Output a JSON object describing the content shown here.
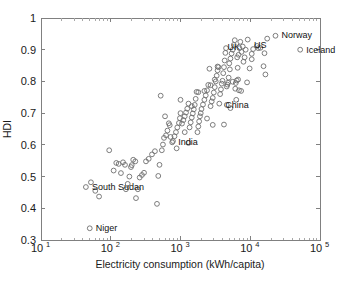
{
  "chart_data": {
    "type": "scatter",
    "title": "",
    "xlabel": "Electricity consumption (kWh/capita)",
    "ylabel": "HDI",
    "xscale": "log",
    "yscale": "linear",
    "xlim": [
      10,
      100000
    ],
    "ylim": [
      0.3,
      1.0
    ],
    "grid": false,
    "legend": "none",
    "marker": "open-circle",
    "marker_color": "#6e6e6e",
    "xticks": [
      {
        "value": 10,
        "label": "10",
        "exponent": "1"
      },
      {
        "value": 100,
        "label": "10",
        "exponent": "2"
      },
      {
        "value": 1000,
        "label": "10",
        "exponent": "3"
      },
      {
        "value": 10000,
        "label": "10",
        "exponent": "4"
      },
      {
        "value": 100000,
        "label": "10",
        "exponent": "5"
      }
    ],
    "yticks": [
      {
        "value": 0.3,
        "label": "0.3"
      },
      {
        "value": 0.4,
        "label": "0.4"
      },
      {
        "value": 0.5,
        "label": "0.5"
      },
      {
        "value": 0.6,
        "label": "0.6"
      },
      {
        "value": 0.7,
        "label": "0.7"
      },
      {
        "value": 0.8,
        "label": "0.8"
      },
      {
        "value": 0.9,
        "label": "0.9"
      },
      {
        "value": 1.0,
        "label": "1"
      }
    ],
    "annotations": [
      {
        "text": "Norway",
        "x": 23000,
        "y": 0.945,
        "dx": 6,
        "dy": 3
      },
      {
        "text": "Iceland",
        "x": 52000,
        "y": 0.9,
        "dx": 6,
        "dy": 3
      },
      {
        "text": "US",
        "x": 12500,
        "y": 0.915,
        "dx": -3,
        "dy": 3
      },
      {
        "text": "UK",
        "x": 5200,
        "y": 0.91,
        "dx": -3,
        "dy": 3
      },
      {
        "text": "China",
        "x": 3600,
        "y": 0.727,
        "dx": 6,
        "dy": 3
      },
      {
        "text": "India",
        "x": 760,
        "y": 0.609,
        "dx": 6,
        "dy": 3
      },
      {
        "text": "South Sudan",
        "x": 44,
        "y": 0.467,
        "dx": 6,
        "dy": 3
      },
      {
        "text": "Niger",
        "x": 50,
        "y": 0.337,
        "dx": 6,
        "dy": 3
      }
    ],
    "points": [
      {
        "x": 52000,
        "y": 0.9
      },
      {
        "x": 23000,
        "y": 0.944
      },
      {
        "x": 17500,
        "y": 0.935
      },
      {
        "x": 16000,
        "y": 0.889
      },
      {
        "x": 15500,
        "y": 0.848
      },
      {
        "x": 16500,
        "y": 0.822
      },
      {
        "x": 14000,
        "y": 0.906
      },
      {
        "x": 13000,
        "y": 0.905
      },
      {
        "x": 12500,
        "y": 0.912
      },
      {
        "x": 11000,
        "y": 0.902
      },
      {
        "x": 10500,
        "y": 0.87
      },
      {
        "x": 9800,
        "y": 0.841
      },
      {
        "x": 9200,
        "y": 0.932
      },
      {
        "x": 8600,
        "y": 0.9
      },
      {
        "x": 8300,
        "y": 0.876
      },
      {
        "x": 8000,
        "y": 0.862
      },
      {
        "x": 7800,
        "y": 0.91
      },
      {
        "x": 7500,
        "y": 0.893
      },
      {
        "x": 7200,
        "y": 0.925
      },
      {
        "x": 7000,
        "y": 0.905
      },
      {
        "x": 6800,
        "y": 0.884
      },
      {
        "x": 6500,
        "y": 0.876
      },
      {
        "x": 6600,
        "y": 0.843
      },
      {
        "x": 6400,
        "y": 0.803
      },
      {
        "x": 6200,
        "y": 0.795
      },
      {
        "x": 6100,
        "y": 0.777
      },
      {
        "x": 6900,
        "y": 0.772
      },
      {
        "x": 6000,
        "y": 0.93
      },
      {
        "x": 5800,
        "y": 0.915
      },
      {
        "x": 5600,
        "y": 0.9
      },
      {
        "x": 5400,
        "y": 0.888
      },
      {
        "x": 5200,
        "y": 0.872
      },
      {
        "x": 5000,
        "y": 0.857
      },
      {
        "x": 5100,
        "y": 0.838
      },
      {
        "x": 4900,
        "y": 0.812
      },
      {
        "x": 4800,
        "y": 0.796
      },
      {
        "x": 4700,
        "y": 0.79
      },
      {
        "x": 4600,
        "y": 0.784
      },
      {
        "x": 4500,
        "y": 0.905
      },
      {
        "x": 4400,
        "y": 0.89
      },
      {
        "x": 4300,
        "y": 0.866
      },
      {
        "x": 4200,
        "y": 0.845
      },
      {
        "x": 4100,
        "y": 0.826
      },
      {
        "x": 4000,
        "y": 0.802
      },
      {
        "x": 3900,
        "y": 0.793
      },
      {
        "x": 3800,
        "y": 0.775
      },
      {
        "x": 3700,
        "y": 0.76
      },
      {
        "x": 3600,
        "y": 0.73
      },
      {
        "x": 3500,
        "y": 0.845
      },
      {
        "x": 3400,
        "y": 0.835
      },
      {
        "x": 3300,
        "y": 0.818
      },
      {
        "x": 3200,
        "y": 0.8
      },
      {
        "x": 3100,
        "y": 0.782
      },
      {
        "x": 3000,
        "y": 0.765
      },
      {
        "x": 2900,
        "y": 0.748
      },
      {
        "x": 2800,
        "y": 0.737
      },
      {
        "x": 2700,
        "y": 0.722
      },
      {
        "x": 2600,
        "y": 0.84
      },
      {
        "x": 2500,
        "y": 0.789
      },
      {
        "x": 2400,
        "y": 0.772
      },
      {
        "x": 2300,
        "y": 0.756
      },
      {
        "x": 2200,
        "y": 0.742
      },
      {
        "x": 2100,
        "y": 0.727
      },
      {
        "x": 2000,
        "y": 0.713
      },
      {
        "x": 1950,
        "y": 0.7
      },
      {
        "x": 1900,
        "y": 0.69
      },
      {
        "x": 1850,
        "y": 0.674
      },
      {
        "x": 1800,
        "y": 0.658
      },
      {
        "x": 1750,
        "y": 0.64
      },
      {
        "x": 1700,
        "y": 0.767
      },
      {
        "x": 1650,
        "y": 0.745
      },
      {
        "x": 1600,
        "y": 0.726
      },
      {
        "x": 1550,
        "y": 0.712
      },
      {
        "x": 1500,
        "y": 0.699
      },
      {
        "x": 1450,
        "y": 0.686
      },
      {
        "x": 1400,
        "y": 0.671
      },
      {
        "x": 1350,
        "y": 0.655
      },
      {
        "x": 1300,
        "y": 0.73
      },
      {
        "x": 1250,
        "y": 0.714
      },
      {
        "x": 1200,
        "y": 0.702
      },
      {
        "x": 1150,
        "y": 0.69
      },
      {
        "x": 1100,
        "y": 0.678
      },
      {
        "x": 1050,
        "y": 0.667
      },
      {
        "x": 1000,
        "y": 0.7
      },
      {
        "x": 980,
        "y": 0.684
      },
      {
        "x": 950,
        "y": 0.669
      },
      {
        "x": 900,
        "y": 0.655
      },
      {
        "x": 860,
        "y": 0.64
      },
      {
        "x": 820,
        "y": 0.627
      },
      {
        "x": 780,
        "y": 0.612
      },
      {
        "x": 760,
        "y": 0.608
      },
      {
        "x": 720,
        "y": 0.625
      },
      {
        "x": 700,
        "y": 0.662
      },
      {
        "x": 680,
        "y": 0.668
      },
      {
        "x": 650,
        "y": 0.645
      },
      {
        "x": 620,
        "y": 0.63
      },
      {
        "x": 600,
        "y": 0.69
      },
      {
        "x": 580,
        "y": 0.622
      },
      {
        "x": 560,
        "y": 0.601
      },
      {
        "x": 540,
        "y": 0.583
      },
      {
        "x": 520,
        "y": 0.755
      },
      {
        "x": 500,
        "y": 0.537
      },
      {
        "x": 480,
        "y": 0.502
      },
      {
        "x": 460,
        "y": 0.414
      },
      {
        "x": 2400,
        "y": 0.683
      },
      {
        "x": 2900,
        "y": 0.663
      },
      {
        "x": 4200,
        "y": 0.664
      },
      {
        "x": 5200,
        "y": 0.716
      },
      {
        "x": 6300,
        "y": 0.742
      },
      {
        "x": 7400,
        "y": 0.77
      },
      {
        "x": 1150,
        "y": 0.64
      },
      {
        "x": 1300,
        "y": 0.606
      },
      {
        "x": 880,
        "y": 0.589
      },
      {
        "x": 430,
        "y": 0.58
      },
      {
        "x": 390,
        "y": 0.57
      },
      {
        "x": 350,
        "y": 0.556
      },
      {
        "x": 320,
        "y": 0.548
      },
      {
        "x": 300,
        "y": 0.512
      },
      {
        "x": 280,
        "y": 0.505
      },
      {
        "x": 260,
        "y": 0.497
      },
      {
        "x": 245,
        "y": 0.46
      },
      {
        "x": 230,
        "y": 0.432
      },
      {
        "x": 225,
        "y": 0.548
      },
      {
        "x": 210,
        "y": 0.553
      },
      {
        "x": 200,
        "y": 0.536
      },
      {
        "x": 195,
        "y": 0.53
      },
      {
        "x": 185,
        "y": 0.5
      },
      {
        "x": 175,
        "y": 0.477
      },
      {
        "x": 165,
        "y": 0.46
      },
      {
        "x": 160,
        "y": 0.537
      },
      {
        "x": 150,
        "y": 0.545
      },
      {
        "x": 140,
        "y": 0.511
      },
      {
        "x": 130,
        "y": 0.54
      },
      {
        "x": 120,
        "y": 0.543
      },
      {
        "x": 110,
        "y": 0.519
      },
      {
        "x": 95,
        "y": 0.583
      },
      {
        "x": 68,
        "y": 0.437
      },
      {
        "x": 60,
        "y": 0.455
      },
      {
        "x": 52,
        "y": 0.482
      },
      {
        "x": 50,
        "y": 0.337
      },
      {
        "x": 44,
        "y": 0.467
      },
      {
        "x": 1000,
        "y": 0.742
      },
      {
        "x": 1450,
        "y": 0.722
      },
      {
        "x": 1800,
        "y": 0.766
      },
      {
        "x": 2200,
        "y": 0.77
      },
      {
        "x": 2700,
        "y": 0.788
      },
      {
        "x": 3100,
        "y": 0.806
      },
      {
        "x": 3400,
        "y": 0.847
      },
      {
        "x": 4600,
        "y": 0.726
      },
      {
        "x": 5600,
        "y": 0.799
      },
      {
        "x": 6700,
        "y": 0.806
      },
      {
        "x": 9000,
        "y": 0.797
      },
      {
        "x": 10500,
        "y": 0.887
      }
    ]
  }
}
